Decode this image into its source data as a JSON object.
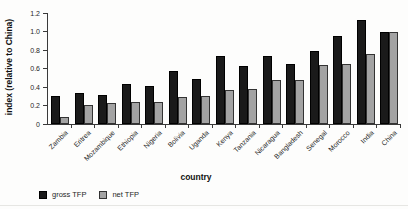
{
  "chart_data": {
    "type": "bar",
    "title": "",
    "xlabel": "country",
    "ylabel": "index (relative to China)",
    "categories": [
      "Zambia",
      "Eritrea",
      "Mozambique",
      "Ethiopia",
      "Nigeria",
      "Bolivia",
      "Uganda",
      "Kenya",
      "Tanzania",
      "Nicaragua",
      "Bangladesh",
      "Senegal",
      "Morocco",
      "India",
      "China"
    ],
    "series": [
      {
        "name": "gross TFP",
        "color": "#1a1a1a",
        "border": "#000000",
        "values": [
          0.3,
          0.34,
          0.31,
          0.43,
          0.41,
          0.57,
          0.49,
          0.73,
          0.63,
          0.74,
          0.65,
          0.79,
          0.95,
          1.12,
          1.0
        ]
      },
      {
        "name": "net TFP",
        "color": "#a3a3a3",
        "border": "#333333",
        "values": [
          0.08,
          0.21,
          0.23,
          0.24,
          0.24,
          0.29,
          0.3,
          0.37,
          0.38,
          0.48,
          0.48,
          0.64,
          0.65,
          0.76,
          1.0
        ]
      }
    ],
    "ylim": [
      0,
      1.2
    ],
    "yticks": [
      0,
      0.2,
      0.4,
      0.6,
      0.8,
      1.0,
      1.2
    ],
    "ytick_labels": [
      "0",
      "0.2",
      "0.4",
      "0.6",
      "0.8",
      "1.0",
      "1.2"
    ],
    "grid": false,
    "legend_position": "bottom-left",
    "bar_orientation": "vertical"
  }
}
